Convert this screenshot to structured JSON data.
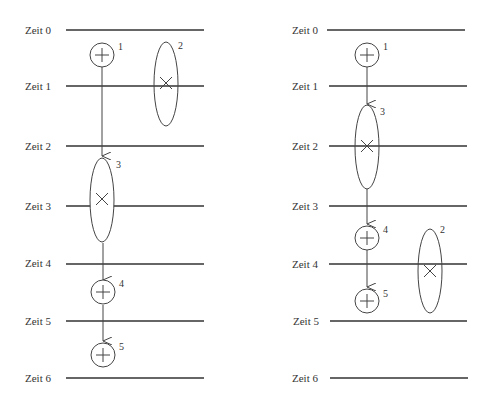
{
  "left_panel": {
    "time_labels": [
      "Zeit 0",
      "Zeit 1",
      "Zeit 2",
      "Zeit 3",
      "Zeit 4",
      "Zeit 5",
      "Zeit 6"
    ],
    "nodes": [
      {
        "id": "1",
        "type": "plus-circle"
      },
      {
        "id": "2",
        "type": "cross-ellipse"
      },
      {
        "id": "3",
        "type": "cross-ellipse"
      },
      {
        "id": "4",
        "type": "plus-circle"
      },
      {
        "id": "5",
        "type": "plus-circle"
      }
    ]
  },
  "right_panel": {
    "time_labels": [
      "Zeit 0",
      "Zeit 1",
      "Zeit 2",
      "Zeit 3",
      "Zeit 4",
      "Zeit 5",
      "Zeit 6"
    ],
    "nodes": [
      {
        "id": "1",
        "type": "plus-circle"
      },
      {
        "id": "3",
        "type": "cross-ellipse"
      },
      {
        "id": "4",
        "type": "plus-circle"
      },
      {
        "id": "2",
        "type": "cross-ellipse"
      },
      {
        "id": "5",
        "type": "plus-circle"
      }
    ]
  },
  "colors": {
    "line": "#333333",
    "background": "#ffffff"
  }
}
